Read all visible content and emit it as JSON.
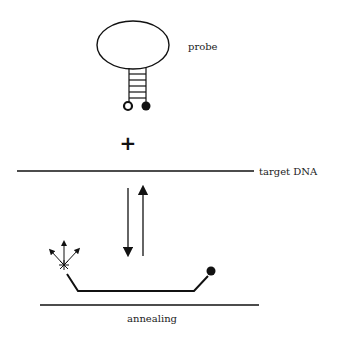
{
  "diagram": {
    "labels": {
      "probe": "probe",
      "plus": "+",
      "target": "target DNA",
      "annealing": "annealing"
    },
    "elements": {
      "probe_loop": "ellipse loop",
      "probe_stem": "ladder stem (5 rungs)",
      "fluorophore": "open circle",
      "quencher": "filled circle",
      "equilibrium_arrows": "down / up arrows",
      "fluorescence_emission": "star with three arrows"
    },
    "colors": {
      "stroke": "#111111",
      "background": "#ffffff"
    }
  }
}
